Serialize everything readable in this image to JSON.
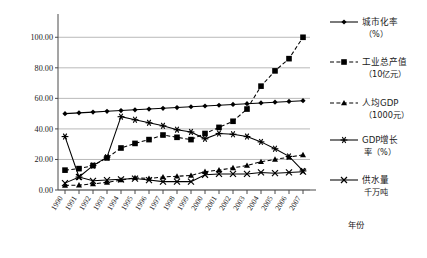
{
  "chart_data": {
    "type": "line",
    "title": "",
    "xlabel": "年份",
    "ylabel": "",
    "grid": true,
    "legend_position": "right",
    "ylim": [
      0,
      110
    ],
    "ytick_labels": [
      "0.00",
      "20.00",
      "40.00",
      "60.00",
      "80.00",
      "100.00"
    ],
    "ytick_values": [
      0,
      20,
      40,
      60,
      80,
      100
    ],
    "categories": [
      "1990",
      "1991",
      "1992",
      "1993",
      "1994",
      "1995",
      "1996",
      "1997",
      "1998",
      "1999",
      "2000",
      "2001",
      "2002",
      "2003",
      "2004",
      "2005",
      "2006",
      "2007"
    ],
    "series": [
      {
        "name": "城市化率（%）",
        "name_line1": "城市化率",
        "name_line2": "（%）",
        "marker": "diamond",
        "linestyle": "solid",
        "color": "#000000",
        "values": [
          50.0,
          50.5,
          51.0,
          51.5,
          52.0,
          52.5,
          53.0,
          53.5,
          54.0,
          54.5,
          55.0,
          55.5,
          56.0,
          56.5,
          57.0,
          57.5,
          58.0,
          58.5
        ]
      },
      {
        "name": "工业总产值（10亿元）",
        "name_line1": "工业总产值",
        "name_line2": "（10亿元）",
        "marker": "square",
        "linestyle": "dashed",
        "color": "#000000",
        "values": [
          13.0,
          14.0,
          16.0,
          21.0,
          27.5,
          30.5,
          33.0,
          36.0,
          34.5,
          33.0,
          37.0,
          41.0,
          45.0,
          53.0,
          68.0,
          78.0,
          86.0,
          100.0
        ]
      },
      {
        "name": "人均GDP（1000元）",
        "name_line1": "人均GDP",
        "name_line2": "（1000元）",
        "marker": "triangle",
        "linestyle": "dashed",
        "color": "#000000",
        "values": [
          3.0,
          3.2,
          4.0,
          5.0,
          6.5,
          8.0,
          7.5,
          8.5,
          9.0,
          9.5,
          12.0,
          13.0,
          14.5,
          16.0,
          18.5,
          20.0,
          21.5,
          23.0
        ]
      },
      {
        "name": "GDP增长率（%）",
        "name_line1": "GDP增长",
        "name_line2": "率（%）",
        "marker": "star",
        "linestyle": "solid",
        "color": "#000000",
        "values": [
          35.0,
          8.5,
          16.0,
          21.5,
          48.0,
          46.0,
          44.0,
          42.0,
          39.5,
          38.0,
          33.5,
          37.0,
          36.5,
          35.0,
          31.5,
          27.0,
          22.0,
          12.5
        ]
      },
      {
        "name": "供水量 千万吨",
        "name_line1": "供水量",
        "name_line2": "千万吨",
        "marker": "cross",
        "linestyle": "solid",
        "color": "#000000",
        "values": [
          4.5,
          8.5,
          6.0,
          6.5,
          7.0,
          7.5,
          6.5,
          5.5,
          5.5,
          5.5,
          10.0,
          10.5,
          10.5,
          10.5,
          11.5,
          11.0,
          11.5,
          12.0
        ]
      }
    ]
  }
}
